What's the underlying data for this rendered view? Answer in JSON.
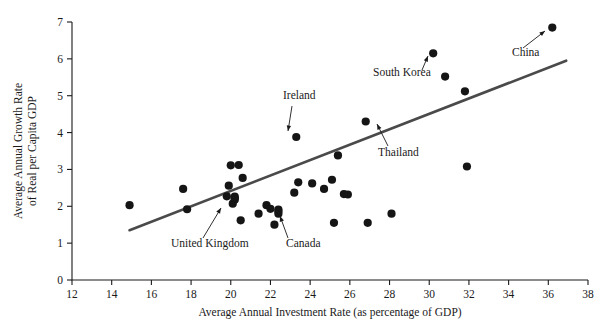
{
  "chart_data": {
    "type": "scatter",
    "title": "",
    "xlabel": "Average Annual Investment Rate (as percentage of GDP)",
    "ylabel": "Average Annual Growth Rate\nof Real per Capita GDP",
    "ylabel_line1": "Average Annual Growth Rate",
    "ylabel_line2": "of Real per Capita GDP",
    "xlim": [
      12,
      38
    ],
    "ylim": [
      0,
      7
    ],
    "xticks": [
      12,
      14,
      16,
      18,
      20,
      22,
      24,
      26,
      28,
      30,
      32,
      34,
      36,
      38
    ],
    "yticks": [
      0,
      1,
      2,
      3,
      4,
      5,
      6,
      7
    ],
    "xtick_labels": [
      "12",
      "14",
      "16",
      "18",
      "20",
      "22",
      "24",
      "26",
      "28",
      "30",
      "32",
      "34",
      "36",
      "38"
    ],
    "ytick_labels": [
      "0",
      "1",
      "2",
      "3",
      "4",
      "5",
      "6",
      "7"
    ],
    "grid": false,
    "legend": false,
    "marker_color": "#151515",
    "trendline_color": "#4a4a4a",
    "axis_color": "#1a1a1a",
    "points": [
      {
        "x": 14.9,
        "y": 2.03
      },
      {
        "x": 17.6,
        "y": 2.47
      },
      {
        "x": 17.8,
        "y": 1.92
      },
      {
        "x": 20.0,
        "y": 3.11
      },
      {
        "x": 20.4,
        "y": 3.12
      },
      {
        "x": 20.6,
        "y": 2.77
      },
      {
        "x": 19.9,
        "y": 2.56
      },
      {
        "x": 19.8,
        "y": 2.27
      },
      {
        "x": 20.2,
        "y": 2.26
      },
      {
        "x": 20.2,
        "y": 2.18
      },
      {
        "x": 20.1,
        "y": 2.07
      },
      {
        "x": 20.5,
        "y": 1.62
      },
      {
        "x": 21.4,
        "y": 1.8
      },
      {
        "x": 21.8,
        "y": 2.03
      },
      {
        "x": 22.0,
        "y": 1.93
      },
      {
        "x": 22.4,
        "y": 1.91
      },
      {
        "x": 22.4,
        "y": 1.8
      },
      {
        "x": 22.2,
        "y": 1.5
      },
      {
        "x": 23.3,
        "y": 3.88,
        "label": "Ireland"
      },
      {
        "x": 23.4,
        "y": 2.65
      },
      {
        "x": 23.2,
        "y": 2.37
      },
      {
        "x": 24.1,
        "y": 2.62
      },
      {
        "x": 24.7,
        "y": 2.47
      },
      {
        "x": 25.2,
        "y": 1.55
      },
      {
        "x": 25.4,
        "y": 3.38
      },
      {
        "x": 25.1,
        "y": 2.72
      },
      {
        "x": 25.7,
        "y": 2.33
      },
      {
        "x": 25.9,
        "y": 2.32
      },
      {
        "x": 26.8,
        "y": 4.3,
        "label": "Thailand"
      },
      {
        "x": 26.9,
        "y": 1.55
      },
      {
        "x": 28.1,
        "y": 1.8
      },
      {
        "x": 30.2,
        "y": 6.15,
        "label": "South Korea"
      },
      {
        "x": 30.8,
        "y": 5.52
      },
      {
        "x": 31.8,
        "y": 5.12
      },
      {
        "x": 31.9,
        "y": 3.08
      },
      {
        "x": 36.2,
        "y": 6.85,
        "label": "China"
      },
      {
        "x": 20.2,
        "y": 2.22,
        "label": "United Kingdom"
      },
      {
        "x": 22.4,
        "y": 1.86,
        "label": "Canada"
      }
    ],
    "trendline": {
      "x1": 14.9,
      "y1": 1.35,
      "x2": 36.9,
      "y2": 5.95
    },
    "annotations": [
      {
        "label": "Ireland",
        "label_x": 283,
        "label_y": 99,
        "ax1": 292,
        "ay1": 106,
        "ax2": 288,
        "ay2": 131
      },
      {
        "label": "South Korea",
        "label_x": 373,
        "label_y": 76,
        "ax1": 422,
        "ay1": 70,
        "ax2": 428,
        "ay2": 56
      },
      {
        "label": "China",
        "label_x": 512,
        "label_y": 56,
        "ax1": 523,
        "ay1": 48,
        "ax2": 545,
        "ay2": 31
      },
      {
        "label": "Thailand",
        "label_x": 378,
        "label_y": 156,
        "ax1": 388,
        "ay1": 146,
        "ax2": 377,
        "ay2": 124
      },
      {
        "label": "United Kingdom",
        "label_x": 171,
        "label_y": 247,
        "ax1": 203,
        "ay1": 238,
        "ax2": 221,
        "ay2": 208
      },
      {
        "label": "Canada",
        "label_x": 286,
        "label_y": 247,
        "ax1": 288,
        "ay1": 238,
        "ax2": 280,
        "ay2": 216
      }
    ]
  }
}
